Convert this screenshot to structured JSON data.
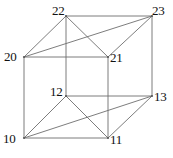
{
  "figure": {
    "width": 173,
    "height": 158,
    "background_color": "#ffffff",
    "edge_color": "#6e6e6e",
    "label_color": "#111111"
  },
  "chart_data": {
    "type": "diagram",
    "subtype": "node-link-graph",
    "xlabel": "",
    "ylabel": "",
    "grid": false,
    "legend": false,
    "nodes": [
      {
        "id": "22",
        "label": "22",
        "x": 66,
        "y": 16,
        "label_x": 52,
        "label_y": 4,
        "label_anchor": "right-above"
      },
      {
        "id": "23",
        "label": "23",
        "x": 152,
        "y": 16,
        "label_x": 152,
        "label_y": 4,
        "label_anchor": "left-above"
      },
      {
        "id": "20",
        "label": "20",
        "x": 24,
        "y": 57,
        "label_x": 4,
        "label_y": 50,
        "label_anchor": "left"
      },
      {
        "id": "21",
        "label": "21",
        "x": 108,
        "y": 57,
        "label_x": 110,
        "label_y": 51,
        "label_anchor": "right"
      },
      {
        "id": "12",
        "label": "12",
        "x": 66,
        "y": 96,
        "label_x": 50,
        "label_y": 85,
        "label_anchor": "left-above"
      },
      {
        "id": "13",
        "label": "13",
        "x": 152,
        "y": 96,
        "label_x": 154,
        "label_y": 90,
        "label_anchor": "right"
      },
      {
        "id": "10",
        "label": "10",
        "x": 24,
        "y": 138,
        "label_x": 3,
        "label_y": 132,
        "label_anchor": "left"
      },
      {
        "id": "11",
        "label": "11",
        "x": 108,
        "y": 138,
        "label_x": 110,
        "label_y": 133,
        "label_anchor": "right"
      }
    ],
    "edges": [
      {
        "source": "22",
        "target": "23",
        "face": "top"
      },
      {
        "source": "20",
        "target": "21",
        "face": "top"
      },
      {
        "source": "20",
        "target": "22",
        "face": "top"
      },
      {
        "source": "21",
        "target": "23",
        "face": "top"
      },
      {
        "source": "22",
        "target": "21",
        "face": "top-diagonal"
      },
      {
        "source": "20",
        "target": "23",
        "face": "top-diagonal"
      },
      {
        "source": "12",
        "target": "13",
        "face": "bottom"
      },
      {
        "source": "10",
        "target": "11",
        "face": "bottom"
      },
      {
        "source": "10",
        "target": "12",
        "face": "bottom"
      },
      {
        "source": "11",
        "target": "13",
        "face": "bottom"
      },
      {
        "source": "12",
        "target": "11",
        "face": "bottom-diagonal"
      },
      {
        "source": "10",
        "target": "13",
        "face": "bottom-diagonal"
      },
      {
        "source": "22",
        "target": "12",
        "face": "vertical"
      },
      {
        "source": "23",
        "target": "13",
        "face": "vertical"
      },
      {
        "source": "20",
        "target": "10",
        "face": "vertical"
      },
      {
        "source": "21",
        "target": "11",
        "face": "vertical"
      }
    ]
  }
}
